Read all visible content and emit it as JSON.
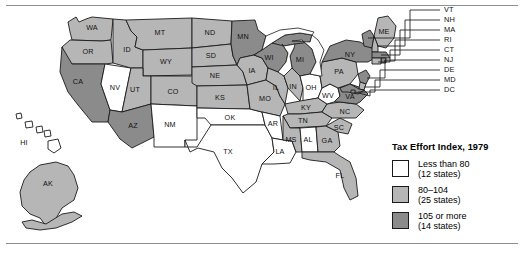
{
  "figure": {
    "width": 524,
    "height": 254,
    "background": "#ffffff",
    "rule_color": "#8f8f8f"
  },
  "legend": {
    "title": "Tax Effort Index, 1979",
    "items": [
      {
        "label": "Less than 80",
        "sub": "(12 states)",
        "color": "#ffffff",
        "key": "low"
      },
      {
        "label": "80–104",
        "sub": "(25 states)",
        "color": "#b6b6b6",
        "key": "mid"
      },
      {
        "label": "105 or more",
        "sub": "(14 states)",
        "color": "#8b8b8b",
        "key": "high"
      }
    ]
  },
  "palette": {
    "low": "#ffffff",
    "mid": "#b6b6b6",
    "high": "#8b8b8b",
    "outline": "#1b1b1b",
    "lake": "#ffffff"
  },
  "callouts": [
    {
      "abbr": "VT",
      "x": 444,
      "y": 10
    },
    {
      "abbr": "NH",
      "x": 444,
      "y": 20
    },
    {
      "abbr": "MA",
      "x": 444,
      "y": 30
    },
    {
      "abbr": "RI",
      "x": 444,
      "y": 40
    },
    {
      "abbr": "CT",
      "x": 444,
      "y": 50
    },
    {
      "abbr": "NJ",
      "x": 444,
      "y": 60
    },
    {
      "abbr": "DE",
      "x": 444,
      "y": 70
    },
    {
      "abbr": "MD",
      "x": 444,
      "y": 80
    },
    {
      "abbr": "DC",
      "x": 444,
      "y": 90
    }
  ],
  "chart_data": {
    "type": "map",
    "title": "Tax Effort Index, 1979",
    "measure": "Tax Effort Index",
    "year": 1979,
    "classes": [
      {
        "key": "low",
        "label": "Less than 80",
        "count": 12,
        "color": "#ffffff"
      },
      {
        "key": "mid",
        "label": "80–104",
        "count": 25,
        "color": "#b6b6b6"
      },
      {
        "key": "high",
        "label": "105 or more",
        "count": 14,
        "color": "#8b8b8b"
      }
    ],
    "states": [
      {
        "abbr": "WA",
        "class": "mid"
      },
      {
        "abbr": "OR",
        "class": "mid"
      },
      {
        "abbr": "CA",
        "class": "high"
      },
      {
        "abbr": "NV",
        "class": "low"
      },
      {
        "abbr": "ID",
        "class": "mid"
      },
      {
        "abbr": "MT",
        "class": "mid"
      },
      {
        "abbr": "WY",
        "class": "mid"
      },
      {
        "abbr": "UT",
        "class": "mid"
      },
      {
        "abbr": "AZ",
        "class": "high"
      },
      {
        "abbr": "CO",
        "class": "mid"
      },
      {
        "abbr": "NM",
        "class": "low"
      },
      {
        "abbr": "ND",
        "class": "mid"
      },
      {
        "abbr": "SD",
        "class": "mid"
      },
      {
        "abbr": "NE",
        "class": "mid"
      },
      {
        "abbr": "KS",
        "class": "mid"
      },
      {
        "abbr": "OK",
        "class": "low"
      },
      {
        "abbr": "TX",
        "class": "low"
      },
      {
        "abbr": "MN",
        "class": "high"
      },
      {
        "abbr": "IA",
        "class": "mid"
      },
      {
        "abbr": "MO",
        "class": "mid"
      },
      {
        "abbr": "AR",
        "class": "low"
      },
      {
        "abbr": "LA",
        "class": "low"
      },
      {
        "abbr": "WI",
        "class": "high"
      },
      {
        "abbr": "IL",
        "class": "mid"
      },
      {
        "abbr": "MI",
        "class": "high"
      },
      {
        "abbr": "IN",
        "class": "mid"
      },
      {
        "abbr": "OH",
        "class": "low"
      },
      {
        "abbr": "KY",
        "class": "mid"
      },
      {
        "abbr": "TN",
        "class": "mid"
      },
      {
        "abbr": "MS",
        "class": "mid"
      },
      {
        "abbr": "AL",
        "class": "low"
      },
      {
        "abbr": "GA",
        "class": "mid"
      },
      {
        "abbr": "FL",
        "class": "mid"
      },
      {
        "abbr": "SC",
        "class": "mid"
      },
      {
        "abbr": "NC",
        "class": "mid"
      },
      {
        "abbr": "VA",
        "class": "high"
      },
      {
        "abbr": "WV",
        "class": "low"
      },
      {
        "abbr": "PA",
        "class": "mid"
      },
      {
        "abbr": "NY",
        "class": "high"
      },
      {
        "abbr": "ME",
        "class": "mid"
      },
      {
        "abbr": "VT",
        "class": "high"
      },
      {
        "abbr": "NH",
        "class": "mid"
      },
      {
        "abbr": "MA",
        "class": "high"
      },
      {
        "abbr": "RI",
        "class": "high"
      },
      {
        "abbr": "CT",
        "class": "mid"
      },
      {
        "abbr": "NJ",
        "class": "high"
      },
      {
        "abbr": "DE",
        "class": "mid"
      },
      {
        "abbr": "MD",
        "class": "high"
      },
      {
        "abbr": "DC",
        "class": "high"
      },
      {
        "abbr": "AK",
        "class": "mid"
      },
      {
        "abbr": "HI",
        "class": "low"
      }
    ]
  }
}
